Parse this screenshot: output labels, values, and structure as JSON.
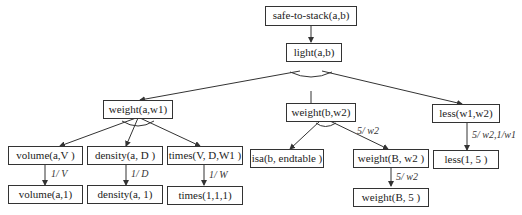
{
  "nodes": {
    "root": "safe-to-stack(a,b)",
    "light": "light(a,b)",
    "weight_a": "weight(a,w1)",
    "weight_b": "weight(b,w2)",
    "less": "less(w1,w2)",
    "volume": "volume(a,V )",
    "density": "density(a, D )",
    "times": "times(V, D,W1 )",
    "isa": "isa(b, endtable )",
    "weight_B": "weight(B, w2 )",
    "less_15": "less(1, 5 )",
    "volume_1": "volume(a,1)",
    "density_1": "density(a, 1)",
    "times_111": "times(1,1,1)",
    "weight_B5": "weight(B, 5 )"
  },
  "edge_labels": {
    "volume": "1/ V",
    "density": "1/ D",
    "times": "1/ W",
    "weight_b_to_B": "5/ w2",
    "weight_B_to_5": "5/ w2",
    "less": "5/ w2,1/w1"
  },
  "colors": {
    "line": "#333333",
    "border": "#333333",
    "text": "#222222"
  }
}
